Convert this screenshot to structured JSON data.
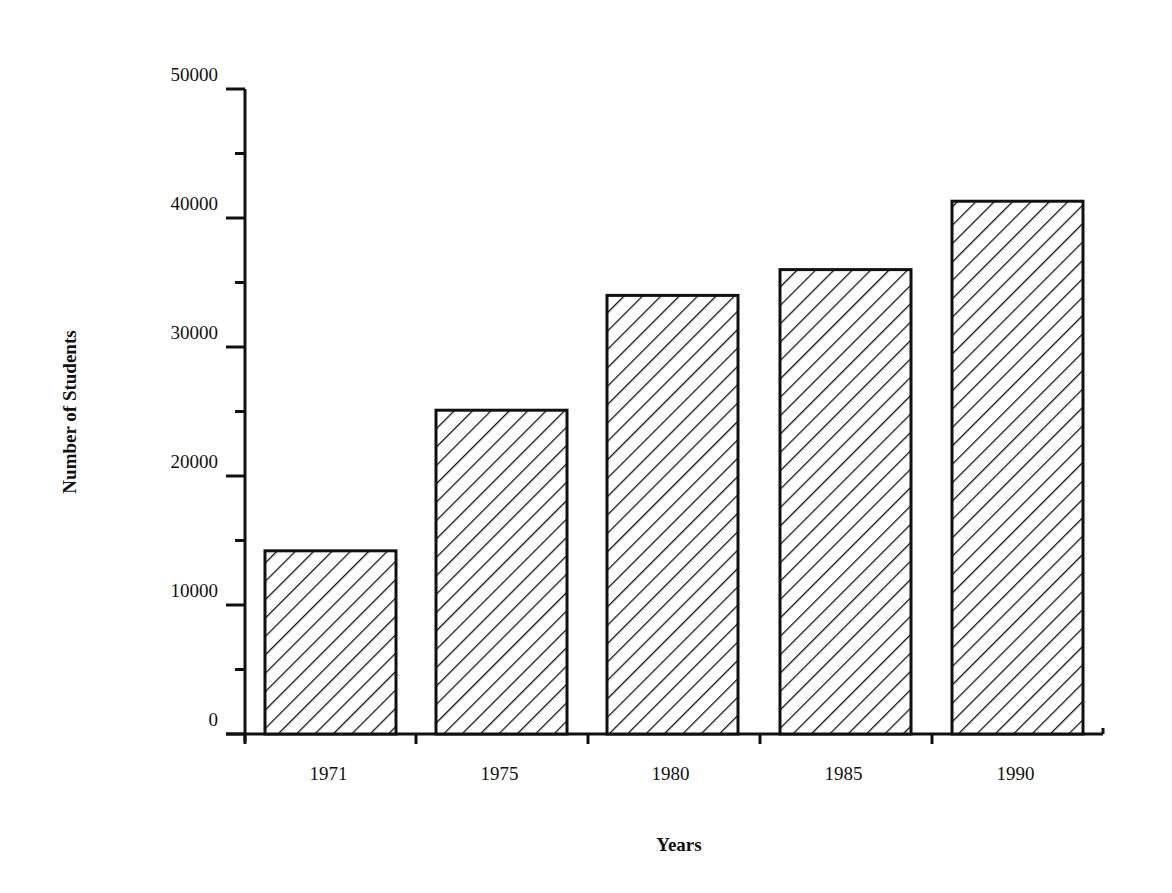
{
  "chart_data": {
    "type": "bar",
    "title": "",
    "xlabel": "Years",
    "ylabel": "Number of Students",
    "categories": [
      "1971",
      "1975",
      "1980",
      "1985",
      "1990"
    ],
    "values": [
      14200,
      25100,
      34000,
      36000,
      41300
    ],
    "ylim": [
      0,
      50000
    ],
    "y_major_ticks": [
      0,
      10000,
      20000,
      30000,
      40000,
      50000
    ],
    "y_major_tick_labels": [
      "0",
      "10000",
      "20000",
      "30000",
      "40000",
      "50000"
    ],
    "y_minor_tick_step": 5000,
    "grid": false,
    "legend": null,
    "bar_fill": "diagonal-hatch",
    "bar_stroke": "#111111",
    "background": "#ffffff"
  }
}
